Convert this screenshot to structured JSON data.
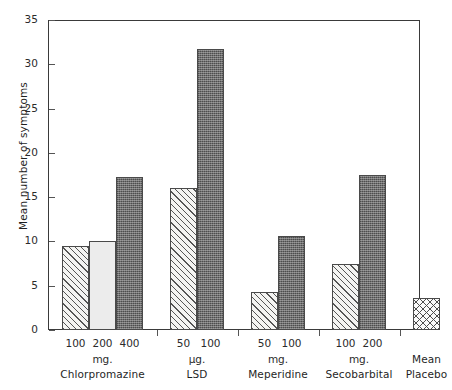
{
  "chart_data": {
    "type": "bar",
    "title": "",
    "xlabel": "",
    "ylabel": "Mean number of symptoms",
    "ylim": [
      0,
      35
    ],
    "yticks": [
      0,
      5,
      10,
      15,
      20,
      25,
      30,
      35
    ],
    "ytick_labels": [
      "0",
      "5",
      "10",
      "15",
      "20",
      "25",
      "30",
      "35"
    ],
    "grid": false,
    "legend": "none",
    "categories": [
      "100 mg. Chlorpromazine",
      "200 mg. Chlorpromazine",
      "400 mg. Chlorpromazine",
      "50 µg. LSD",
      "100 µg. LSD",
      "50 mg. Meperidine",
      "100 mg. Meperidine",
      "100 mg. Secobarbital",
      "200 mg. Secobarbital",
      "Mean Placebo"
    ],
    "values": [
      9.5,
      10.0,
      17.3,
      16.0,
      31.7,
      4.3,
      10.6,
      7.4,
      17.5,
      3.6
    ],
    "groups": [
      {
        "name": "Chlorpromazine",
        "unit": "mg.",
        "bars": [
          {
            "dose": "100",
            "value": 9.5,
            "pattern": "hatch"
          },
          {
            "dose": "200",
            "value": 10.0,
            "pattern": "plain"
          },
          {
            "dose": "400",
            "value": 17.3,
            "pattern": "dark"
          }
        ]
      },
      {
        "name": "LSD",
        "unit": "µg.",
        "bars": [
          {
            "dose": "50",
            "value": 16.0,
            "pattern": "hatch"
          },
          {
            "dose": "100",
            "value": 31.7,
            "pattern": "dark"
          }
        ]
      },
      {
        "name": "Meperidine",
        "unit": "mg.",
        "bars": [
          {
            "dose": "50",
            "value": 4.3,
            "pattern": "hatch"
          },
          {
            "dose": "100",
            "value": 10.6,
            "pattern": "dark"
          }
        ]
      },
      {
        "name": "Secobarbital",
        "unit": "mg.",
        "bars": [
          {
            "dose": "100",
            "value": 7.4,
            "pattern": "hatch"
          },
          {
            "dose": "200",
            "value": 17.5,
            "pattern": "dark"
          }
        ]
      },
      {
        "name": "Mean\nPlacebo",
        "name_line1": "Mean",
        "name_line2": "Placebo",
        "unit": "",
        "bars": [
          {
            "dose": "",
            "value": 3.6,
            "pattern": "diamond"
          }
        ]
      }
    ],
    "colors": {
      "axis": "#3a3a3a",
      "text": "#1f1f1f",
      "bar_hatch": "#f4f4f2",
      "bar_plain": "#ececec",
      "bar_dark": "#6e6e6e",
      "bar_diamond": "#fafafa"
    }
  }
}
